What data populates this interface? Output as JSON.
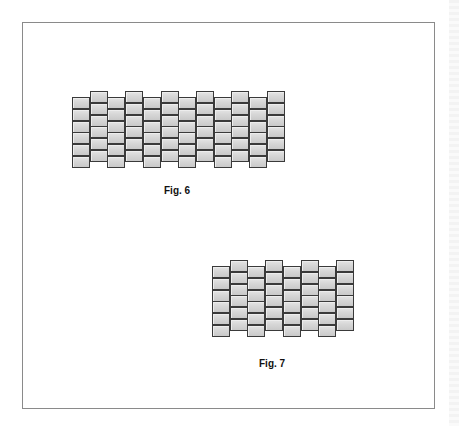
{
  "figures": [
    {
      "id": "fig6",
      "caption": "Fig. 6",
      "columns": 12,
      "bricks_per_column": 6,
      "pattern": "alternating-offset",
      "first_column_offset": "low"
    },
    {
      "id": "fig7",
      "caption": "Fig. 7",
      "columns": 8,
      "bricks_per_column": 6,
      "pattern": "alternating-offset",
      "first_column_offset": "low"
    }
  ],
  "colors": {
    "brick_fill": "#d6d6d6",
    "brick_border": "#3a3a3a",
    "frame_border": "#8a8a8a"
  }
}
